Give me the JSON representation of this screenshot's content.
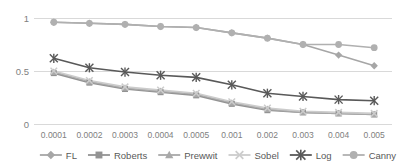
{
  "chart_data": {
    "type": "line",
    "title": "",
    "xlabel": "",
    "ylabel": "",
    "categories": [
      "0.0001",
      "0.0002",
      "0.0003",
      "0.0004",
      "0.0005",
      "0.001",
      "0.002",
      "0.003",
      "0.004",
      "0.005"
    ],
    "ylim": [
      0,
      1
    ],
    "yticks": [
      "0",
      "0.5",
      "1"
    ],
    "ytick_values": [
      0,
      0.5,
      1
    ],
    "grid": true,
    "legend_position": "bottom",
    "series": [
      {
        "name": "FL",
        "marker": "diamond",
        "color": "#a6a6a6",
        "values": [
          0.96,
          0.95,
          0.94,
          0.92,
          0.91,
          0.86,
          0.81,
          0.75,
          0.65,
          0.55
        ]
      },
      {
        "name": "Roberts",
        "marker": "square",
        "color": "#939393",
        "values": [
          0.48,
          0.39,
          0.33,
          0.3,
          0.27,
          0.19,
          0.13,
          0.11,
          0.1,
          0.09
        ]
      },
      {
        "name": "Prewwit",
        "marker": "triangle",
        "color": "#a9a9a9",
        "values": [
          0.49,
          0.4,
          0.34,
          0.31,
          0.28,
          0.2,
          0.14,
          0.11,
          0.1,
          0.09
        ]
      },
      {
        "name": "Sobel",
        "marker": "x",
        "color": "#cccccc",
        "values": [
          0.5,
          0.41,
          0.35,
          0.32,
          0.29,
          0.21,
          0.15,
          0.12,
          0.11,
          0.1
        ]
      },
      {
        "name": "Log",
        "marker": "asterisk",
        "color": "#595959",
        "values": [
          0.62,
          0.53,
          0.49,
          0.46,
          0.44,
          0.37,
          0.29,
          0.26,
          0.23,
          0.22
        ]
      },
      {
        "name": "Canny",
        "marker": "circle",
        "color": "#b0b0b0",
        "values": [
          0.96,
          0.95,
          0.94,
          0.92,
          0.91,
          0.86,
          0.81,
          0.75,
          0.75,
          0.72
        ]
      }
    ]
  }
}
